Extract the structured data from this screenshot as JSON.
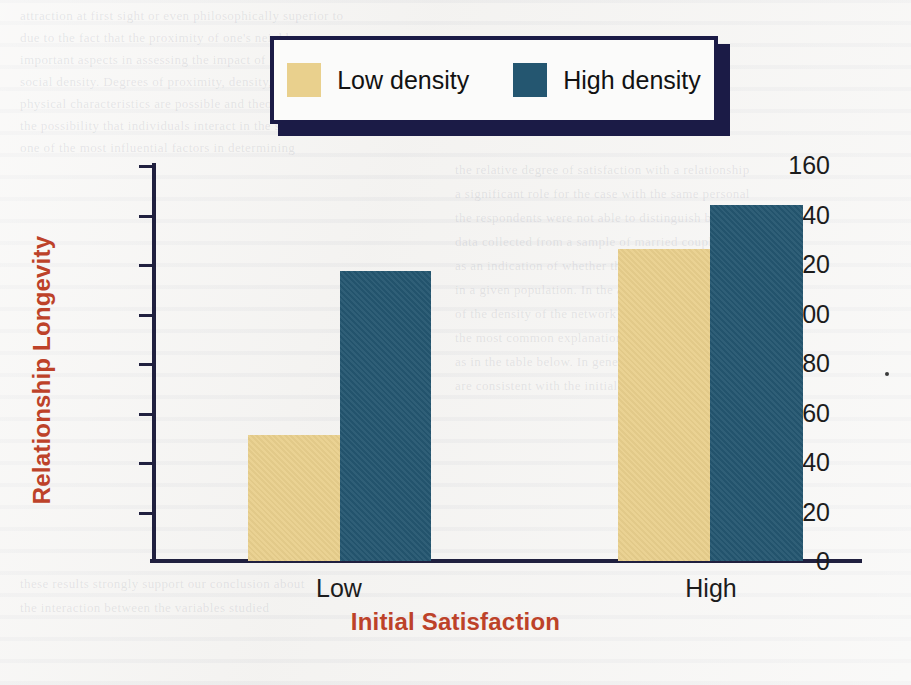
{
  "figure": {
    "background_color": "#f4f3f1",
    "accent_color": "#bd4229",
    "legend_border_color": "#1b1b46"
  },
  "legend": {
    "position": "top-center",
    "items": [
      {
        "label": "Low density",
        "color": "#e9d08d",
        "swatch_name": "legend-swatch-low-density"
      },
      {
        "label": "High density",
        "color": "#245670",
        "swatch_name": "legend-swatch-high-density"
      }
    ]
  },
  "axes": {
    "y_title": "Relationship Longevity",
    "x_title": "Initial Satisfaction",
    "y_ticks": [
      "160",
      "140",
      "120",
      "100",
      "80",
      "60",
      "40",
      "20",
      "0"
    ],
    "x_categories": [
      "Low",
      "High"
    ]
  },
  "chart_data": {
    "type": "bar",
    "title": "",
    "xlabel": "Initial Satisfaction",
    "ylabel": "Relationship Longevity",
    "categories": [
      "Low",
      "High"
    ],
    "series": [
      {
        "name": "Low density",
        "color": "#e9d08d",
        "values": [
          51,
          126
        ]
      },
      {
        "name": "High density",
        "color": "#245670",
        "values": [
          117,
          144
        ]
      }
    ],
    "ylim": [
      0,
      160
    ],
    "ytick_interval": 20,
    "grid": false,
    "legend_position": "top-center"
  },
  "ghost_text": {
    "lines": [
      "attraction at first sight or even philosophically superior to",
      "due to the fact that the proximity of one's neighbours was",
      "important aspects in assessing the impact of social",
      "social density. Degrees of proximity, density, and a",
      "physical characteristics are possible and theoretical",
      "the possibility that individuals interact in the space",
      "one of the most influential factors in determining",
      "the relative degree of satisfaction with a relationship",
      "a significant role for the case with the same personal",
      "the respondents were not able to distinguish between",
      "data collected from a sample of married couples",
      "as an indication of whether the relationship was",
      "in a given population. In the absence of a standard",
      "of the density of the network of social relations",
      "the most common explanation for this pattern is",
      "as in the table below. In general, the results",
      "are consistent with the initial hypothesis",
      "these results strongly support our conclusion about",
      "the interaction between the variables studied"
    ]
  }
}
